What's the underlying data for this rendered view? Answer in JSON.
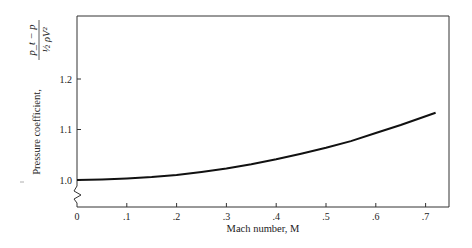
{
  "chart_data": {
    "type": "line",
    "title": "",
    "xlabel": "Mach number, M",
    "ylabel": "Pressure coefficient, (p_t − p) / (½ρV²)",
    "ylabel_text": "Pressure coefficient,",
    "ylabel_fraction": {
      "numerator": "p_t − p",
      "denominator": "½ ρV²"
    },
    "xlim": [
      0,
      0.75
    ],
    "ylim": [
      0.95,
      1.3
    ],
    "x_ticks": [
      0,
      0.1,
      0.2,
      0.3,
      0.4,
      0.5,
      0.6,
      0.7
    ],
    "x_tick_labels": [
      "0",
      ".1",
      ".2",
      ".3",
      ".4",
      ".5",
      ".6",
      ".7"
    ],
    "y_ticks": [
      1.0,
      1.1,
      1.2
    ],
    "y_tick_labels": [
      "1.0",
      "1.1",
      "1.2"
    ],
    "y_axis_break": true,
    "grid": false,
    "legend": null,
    "series": [
      {
        "name": "Cp",
        "x": [
          0,
          0.05,
          0.1,
          0.15,
          0.2,
          0.25,
          0.3,
          0.35,
          0.4,
          0.45,
          0.5,
          0.55,
          0.6,
          0.65,
          0.72
        ],
        "y": [
          1.0,
          1.001,
          1.003,
          1.006,
          1.01,
          1.016,
          1.023,
          1.031,
          1.041,
          1.052,
          1.064,
          1.077,
          1.093,
          1.109,
          1.133
        ]
      }
    ]
  }
}
